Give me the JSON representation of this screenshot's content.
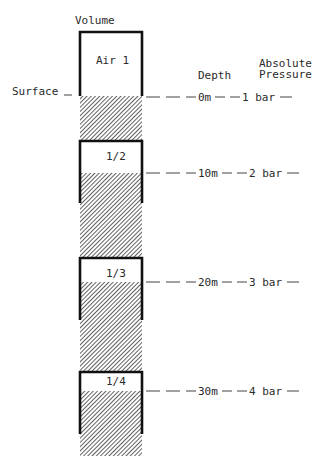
{
  "title": "Volume",
  "headers": {
    "depth": "Depth",
    "pressure_line1": "Absolute",
    "pressure_line2": "Pressure"
  },
  "surface_label": "Surface",
  "levels": [
    {
      "volume": "Air 1",
      "depth": "0m",
      "pressure": "1 bar",
      "air_fraction": 1.0
    },
    {
      "volume": "1/2",
      "depth": "10m",
      "pressure": "2 bar",
      "air_fraction": 0.5
    },
    {
      "volume": "1/3",
      "depth": "20m",
      "pressure": "3 bar",
      "air_fraction": 0.333
    },
    {
      "volume": "1/4",
      "depth": "30m",
      "pressure": "4 bar",
      "air_fraction": 0.25
    }
  ]
}
